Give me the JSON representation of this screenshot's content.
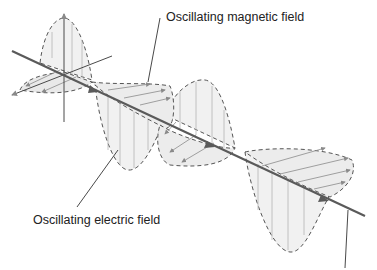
{
  "diagram": {
    "labels": {
      "magnetic": "Oscillating magnetic field",
      "electric": "Oscillating electric field"
    },
    "colors": {
      "axis": "#5a5a5a",
      "field_fill": "#f0f0f0",
      "dashed_outline": "#555555",
      "field_vector": "#9a9a9a",
      "leader": "#333333",
      "text": "#222222"
    }
  }
}
